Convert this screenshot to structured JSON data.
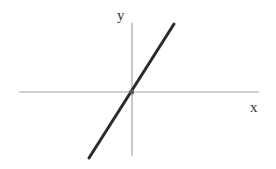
{
  "diagram": {
    "type": "cartesian-line-through-origin",
    "x_axis_label": "x",
    "y_axis_label": "y",
    "colors": {
      "axis": "#a6a6a6",
      "line": "#2b2b2b",
      "label": "#333333",
      "background": "#ffffff"
    }
  }
}
